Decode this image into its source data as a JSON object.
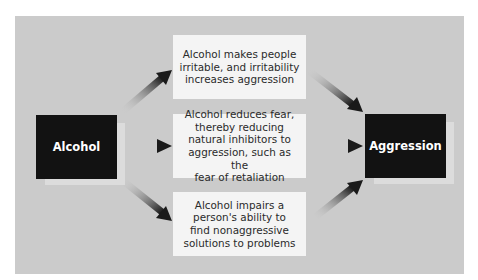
{
  "diagram": {
    "source_node": {
      "label": "Alcohol"
    },
    "target_node": {
      "label": "Aggression"
    },
    "pathways": [
      {
        "lines": [
          "Alcohol makes people",
          "irritable, and irritability",
          "increases aggression"
        ]
      },
      {
        "lines": [
          "Alcohol reduces fear,",
          "thereby reducing",
          "natural inhibitors to",
          "aggression, such as the",
          "fear of retaliation"
        ]
      },
      {
        "lines": [
          "Alcohol impairs a",
          "person's ability to",
          "find nonaggressive",
          "solutions to problems"
        ]
      }
    ],
    "colors": {
      "panel": "#cbcbcb",
      "node_dark": "#121212",
      "node_light": "#f4f4f4",
      "arrow": "#1a1a1a"
    }
  }
}
